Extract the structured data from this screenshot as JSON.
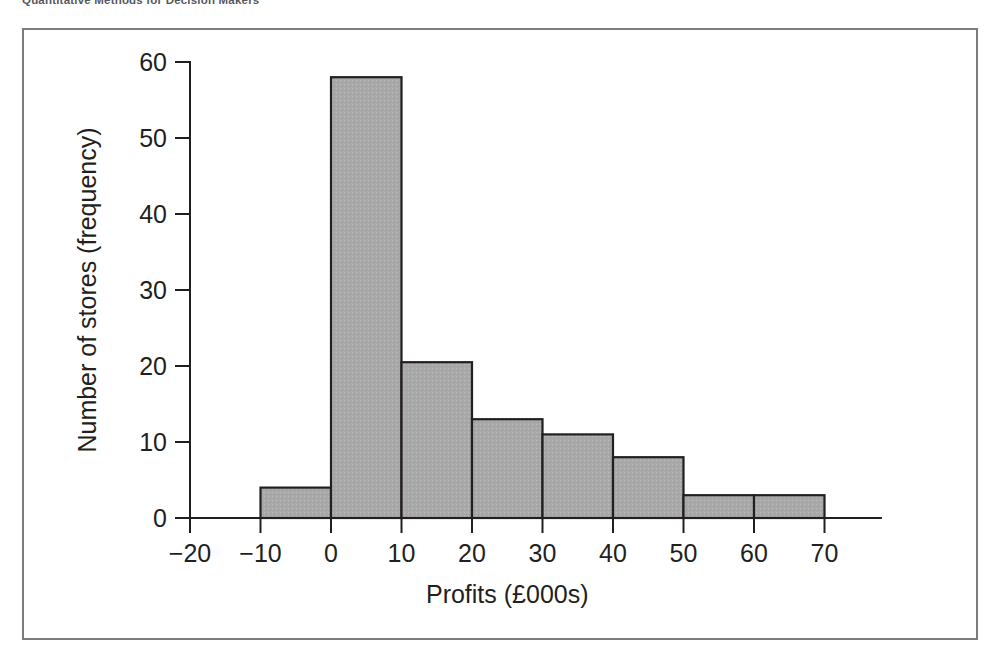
{
  "header": {
    "running_title": "Quantitative Methods for Decision Makers"
  },
  "figure": {
    "frame_color": "#7c7c80",
    "background": "#ffffff"
  },
  "chart_data": {
    "type": "bar",
    "title": "",
    "subtitle": "",
    "xlabel": "Profits (£000s)",
    "ylabel": "Number of stores (frequency)",
    "xlim": [
      -20,
      78
    ],
    "ylim": [
      0,
      62
    ],
    "xticks": [
      -20,
      -10,
      0,
      10,
      20,
      30,
      40,
      50,
      60,
      70
    ],
    "xtick_labels": [
      "−20",
      "−10",
      "0",
      "10",
      "20",
      "30",
      "40",
      "50",
      "60",
      "70"
    ],
    "yticks": [
      0,
      10,
      20,
      30,
      40,
      50,
      60
    ],
    "ytick_labels": [
      "0",
      "10",
      "20",
      "30",
      "40",
      "50",
      "60"
    ],
    "grid": false,
    "legend": null,
    "bar_fill": "#a9a9a9",
    "bar_edge": "#231f20",
    "bin_width": 10,
    "categories": [
      "-10 to 0",
      "0 to 10",
      "10 to 20",
      "20 to 30",
      "30 to 40",
      "40 to 50",
      "50 to 60",
      "60 to 70"
    ],
    "bins": [
      {
        "start": -10,
        "end": 0,
        "value": 4
      },
      {
        "start": 0,
        "end": 10,
        "value": 58
      },
      {
        "start": 10,
        "end": 20,
        "value": 20.5
      },
      {
        "start": 20,
        "end": 30,
        "value": 13
      },
      {
        "start": 30,
        "end": 40,
        "value": 11
      },
      {
        "start": 40,
        "end": 50,
        "value": 8
      },
      {
        "start": 50,
        "end": 60,
        "value": 3
      },
      {
        "start": 60,
        "end": 70,
        "value": 3
      }
    ],
    "values": [
      4,
      58,
      20.5,
      13,
      11,
      8,
      3,
      3
    ],
    "annotations": []
  }
}
